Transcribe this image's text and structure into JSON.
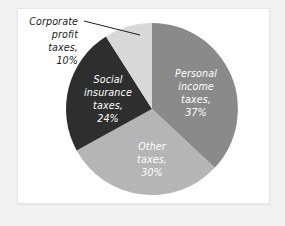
{
  "figure": {
    "background_color": "#f2f2f2",
    "card_color": "#ffffff",
    "card_border_color": "#e6e6e6"
  },
  "chart_data": {
    "type": "pie",
    "title": "",
    "subtitle": "",
    "xlabel": "",
    "ylabel": "",
    "legend_position": "none",
    "grid": false,
    "start_angle_deg": 0,
    "direction": "clockwise",
    "categories": [
      "Personal income taxes",
      "Other taxes",
      "Social insurance taxes",
      "Corporate profit taxes"
    ],
    "values": [
      37,
      30,
      24,
      10
    ],
    "value_unit": "percent",
    "colors": [
      "#8a8a8a",
      "#b5b5b5",
      "#2e2e2e",
      "#d8d8d8"
    ],
    "slices": [
      {
        "name": "Personal income taxes",
        "value": 37,
        "percent_text": "37%",
        "color": "#8a8a8a",
        "label_lines": [
          "Personal",
          "income",
          "taxes,",
          "37%"
        ],
        "label_placement": "inside",
        "label_color": "#ffffff",
        "start_deg": 0,
        "end_deg": 133.2
      },
      {
        "name": "Other taxes",
        "value": 30,
        "percent_text": "30%",
        "color": "#b5b5b5",
        "label_lines": [
          "Other",
          "taxes,",
          "30%"
        ],
        "label_placement": "inside",
        "label_color": "#ffffff",
        "start_deg": 133.2,
        "end_deg": 241.2
      },
      {
        "name": "Social insurance taxes",
        "value": 24,
        "percent_text": "24%",
        "color": "#2e2e2e",
        "label_lines": [
          "Social",
          "insurance",
          "taxes,",
          "24%"
        ],
        "label_placement": "inside",
        "label_color": "#ffffff",
        "start_deg": 241.2,
        "end_deg": 327.6
      },
      {
        "name": "Corporate profit taxes",
        "value": 10,
        "percent_text": "10%",
        "color": "#d8d8d8",
        "label_lines": [
          "Corporate",
          "profit",
          "taxes,",
          "10%"
        ],
        "label_placement": "callout",
        "label_color": "#1c1c1c",
        "start_deg": 327.6,
        "end_deg": 360
      }
    ]
  },
  "labels": {
    "personal_income": {
      "line1": "Personal",
      "line2": "income",
      "line3": "taxes,",
      "line4": "37%"
    },
    "other_taxes": {
      "line1": "Other",
      "line2": "taxes,",
      "line3": "30%"
    },
    "social_insurance": {
      "line1": "Social",
      "line2": "insurance",
      "line3": "taxes,",
      "line4": "24%"
    },
    "corporate_profit": {
      "line1": "Corporate",
      "line2": "profit",
      "line3": "taxes,",
      "line4": "10%"
    }
  }
}
